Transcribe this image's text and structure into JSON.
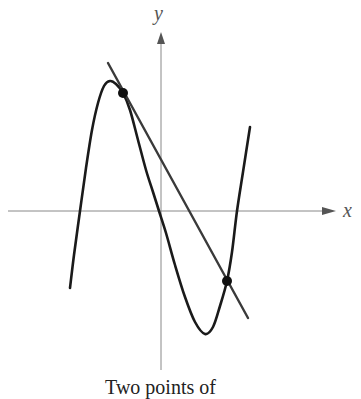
{
  "figure": {
    "x_axis_label": "x",
    "y_axis_label": "y",
    "caption": "Two points of",
    "colors": {
      "axis": "#888888",
      "curve": "#1a1a1a",
      "secant_line": "#3a3a3a",
      "points": "#111111",
      "background": "#ffffff"
    }
  },
  "chart_data": {
    "type": "line",
    "title": "",
    "caption": "Two points of",
    "xlabel": "x",
    "ylabel": "y",
    "grid": false,
    "axes": {
      "origin_px": [
        161,
        211
      ],
      "x_axis_px": {
        "from": 8,
        "to": 336
      },
      "y_axis_px": {
        "from": 370,
        "to": 32
      }
    },
    "series": [
      {
        "name": "cubic curve",
        "kind": "curve",
        "points_px": [
          [
            70,
            288
          ],
          [
            74,
            255
          ],
          [
            80,
            211
          ],
          [
            86,
            168
          ],
          [
            92,
            130
          ],
          [
            98,
            103
          ],
          [
            104,
            86
          ],
          [
            110,
            81
          ],
          [
            116,
            84
          ],
          [
            123,
            93
          ],
          [
            130,
            110
          ],
          [
            138,
            140
          ],
          [
            146,
            170
          ],
          [
            153,
            192
          ],
          [
            159,
            211
          ],
          [
            166,
            233
          ],
          [
            175,
            265
          ],
          [
            185,
            297
          ],
          [
            195,
            322
          ],
          [
            205,
            334
          ],
          [
            213,
            327
          ],
          [
            220,
            306
          ],
          [
            227,
            281
          ],
          [
            232,
            252
          ],
          [
            237,
            211
          ],
          [
            243,
            172
          ],
          [
            250,
            127
          ]
        ]
      },
      {
        "name": "secant line",
        "kind": "line",
        "points_px": [
          [
            108,
            63
          ],
          [
            248,
            318
          ]
        ]
      }
    ],
    "annotations": [
      {
        "type": "point",
        "label": "intersection 1",
        "px": [
          123,
          93
        ]
      },
      {
        "type": "point",
        "label": "intersection 2",
        "px": [
          227,
          281
        ]
      }
    ]
  }
}
